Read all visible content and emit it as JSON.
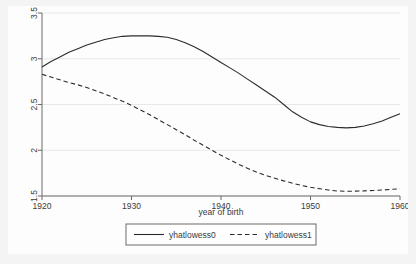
{
  "figure": {
    "background_color": "#f4f4f4",
    "panel_color": "#fdfdfd",
    "axis_color": "#6b6b6b",
    "grid_color": "#e8e8e8",
    "series_color": "#2b2b2b"
  },
  "chart_data": {
    "type": "line",
    "title": "",
    "subtitle": "",
    "xlabel": "year of birth",
    "ylabel": "",
    "xlim": [
      1920,
      1960
    ],
    "ylim": [
      1.5,
      3.5
    ],
    "xticks": [
      1920,
      1930,
      1940,
      1950,
      1960
    ],
    "xtick_labels": [
      "1920",
      "1930",
      "1940",
      "1950",
      "1960"
    ],
    "yticks": [
      1.5,
      2,
      2.5,
      3,
      3.5
    ],
    "ytick_labels": [
      "1.5",
      "2",
      "2.5",
      "3",
      "3.5"
    ],
    "grid": true,
    "grid_axis": "y",
    "legend_position": "bottom-outside",
    "x": [
      1920,
      1921,
      1922,
      1923,
      1924,
      1925,
      1926,
      1927,
      1928,
      1929,
      1930,
      1931,
      1932,
      1933,
      1934,
      1935,
      1936,
      1937,
      1938,
      1939,
      1940,
      1941,
      1942,
      1943,
      1944,
      1945,
      1946,
      1947,
      1948,
      1949,
      1950,
      1951,
      1952,
      1953,
      1954,
      1955,
      1956,
      1957,
      1958,
      1959,
      1960
    ],
    "series": [
      {
        "name": "yhatlowess0",
        "style": "solid",
        "values": [
          2.91,
          2.97,
          3.02,
          3.07,
          3.11,
          3.15,
          3.18,
          3.21,
          3.23,
          3.245,
          3.25,
          3.252,
          3.25,
          3.245,
          3.235,
          3.21,
          3.175,
          3.13,
          3.08,
          3.02,
          2.96,
          2.9,
          2.84,
          2.775,
          2.71,
          2.645,
          2.58,
          2.5,
          2.42,
          2.36,
          2.31,
          2.28,
          2.26,
          2.25,
          2.245,
          2.25,
          2.265,
          2.29,
          2.32,
          2.36,
          2.4
        ]
      },
      {
        "name": "yhatlowess1",
        "style": "dashed",
        "values": [
          2.83,
          2.8,
          2.77,
          2.74,
          2.715,
          2.685,
          2.65,
          2.615,
          2.575,
          2.535,
          2.49,
          2.44,
          2.39,
          2.335,
          2.28,
          2.225,
          2.17,
          2.11,
          2.055,
          2.0,
          1.945,
          1.895,
          1.845,
          1.8,
          1.76,
          1.725,
          1.695,
          1.665,
          1.64,
          1.615,
          1.595,
          1.58,
          1.565,
          1.555,
          1.552,
          1.553,
          1.556,
          1.56,
          1.565,
          1.572,
          1.58
        ]
      }
    ]
  },
  "legend": {
    "entries": [
      {
        "label": "yhatlowess0",
        "style": "solid"
      },
      {
        "label": "yhatlowess1",
        "style": "dashed"
      }
    ]
  }
}
